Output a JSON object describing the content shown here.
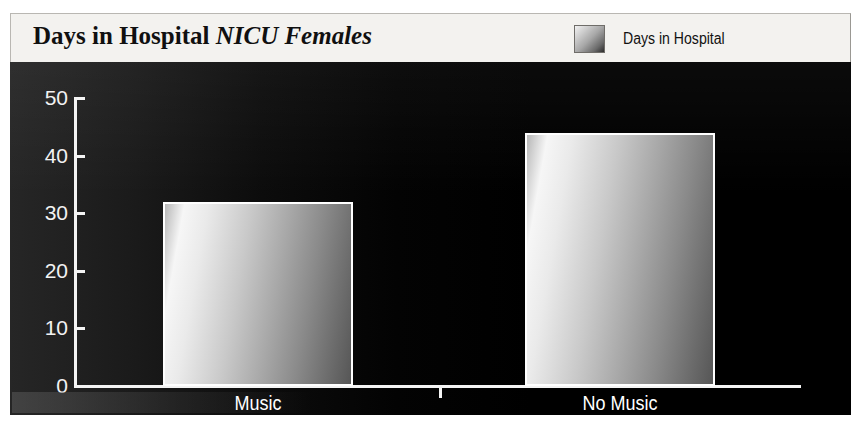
{
  "header": {
    "title_main": "Days in Hospital ",
    "title_italic": "NICU Females",
    "legend_label": "Days in Hospital",
    "legend_swatch_name": "gradient-swatch"
  },
  "chart_data": {
    "type": "bar",
    "title": "Days in Hospital NICU Females",
    "xlabel": "",
    "ylabel": "",
    "categories": [
      "Music",
      "No Music"
    ],
    "values": [
      32,
      44
    ],
    "series": [
      {
        "name": "Days in Hospital",
        "values": [
          32,
          44
        ]
      }
    ],
    "ylim": [
      0,
      50
    ],
    "yticks": [
      0,
      10,
      20,
      30,
      40,
      50
    ],
    "ytick_labels": [
      "0",
      "10",
      "20",
      "30",
      "40",
      "50"
    ],
    "grid": false,
    "legend_position": "top-right",
    "bar_style": "horizontal-gradient-grayscale",
    "background": "#000000",
    "axis_color": "#f4f4f4",
    "text_color": "#ffffff"
  },
  "colors": {
    "header_background": "#f3f2ef",
    "plot_background": "#000000",
    "axis": "#f4f4f4",
    "bar_light": "#f6f6f6",
    "bar_dark": "#565656",
    "title_text": "#101010",
    "label_text": "#ffffff"
  }
}
